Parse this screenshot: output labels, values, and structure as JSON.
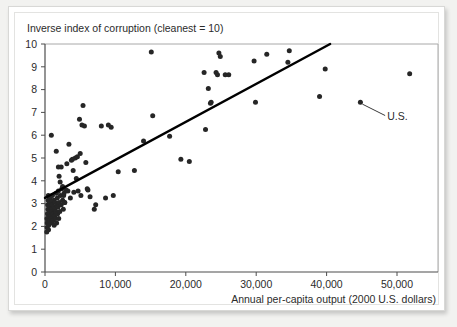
{
  "figure": {
    "title": "Inverse index of corruption (cleanest = 10)",
    "x_axis_label": "Annual per-capita output (2000 U.S. dollars)",
    "annotation_label": "U.S.",
    "point_color": "#262626",
    "trend_color": "#000000",
    "axis_color": "#4d4d4d",
    "background_color": "#ffffff"
  },
  "chart_data": {
    "type": "scatter",
    "title": "Inverse index of corruption (cleanest = 10)",
    "xlabel": "Annual per-capita output (2000 U.S. dollars)",
    "ylabel": "Inverse index of corruption (cleanest = 10)",
    "xlim": [
      0,
      55000
    ],
    "ylim": [
      0,
      10
    ],
    "grid": false,
    "legend": null,
    "xticks": [
      0,
      10000,
      20000,
      30000,
      40000,
      50000
    ],
    "xticklabels": [
      "0",
      "10,000",
      "20,000",
      "30,000",
      "40,000",
      "50,000"
    ],
    "yticks": [
      0,
      1,
      2,
      3,
      4,
      5,
      6,
      7,
      8,
      9,
      10
    ],
    "yticklabels": [
      "0",
      "1",
      "2",
      "3",
      "4",
      "5",
      "6",
      "7",
      "8",
      "9",
      "10"
    ],
    "annotations": [
      {
        "text": "U.S.",
        "point_x": 44800,
        "point_y": 7.45,
        "label_x": 48600,
        "label_y": 6.95
      }
    ],
    "trendline": {
      "type": "linear",
      "x_start": 0,
      "y_start": 3.25,
      "x_end": 40500,
      "y_end": 10.0
    },
    "points": [
      [
        250,
        1.75
      ],
      [
        300,
        1.95
      ],
      [
        320,
        2.15
      ],
      [
        280,
        2.35
      ],
      [
        350,
        2.55
      ],
      [
        400,
        2.25
      ],
      [
        420,
        2.75
      ],
      [
        380,
        2.95
      ],
      [
        450,
        3.15
      ],
      [
        470,
        3.35
      ],
      [
        500,
        1.85
      ],
      [
        520,
        2.05
      ],
      [
        560,
        2.45
      ],
      [
        590,
        2.65
      ],
      [
        610,
        2.85
      ],
      [
        640,
        3.05
      ],
      [
        680,
        2.25
      ],
      [
        700,
        2.55
      ],
      [
        720,
        3.25
      ],
      [
        760,
        2.95
      ],
      [
        800,
        2.15
      ],
      [
        830,
        2.45
      ],
      [
        860,
        2.75
      ],
      [
        900,
        3.05
      ],
      [
        940,
        2.35
      ],
      [
        980,
        2.65
      ],
      [
        1000,
        2.95
      ],
      [
        1050,
        3.35
      ],
      [
        1100,
        2.25
      ],
      [
        1150,
        2.55
      ],
      [
        1200,
        2.85
      ],
      [
        1250,
        3.15
      ],
      [
        1300,
        2.05
      ],
      [
        1350,
        2.45
      ],
      [
        1400,
        2.75
      ],
      [
        1450,
        3.05
      ],
      [
        1500,
        2.35
      ],
      [
        1550,
        2.65
      ],
      [
        1600,
        3.45
      ],
      [
        1650,
        2.15
      ],
      [
        1700,
        2.95
      ],
      [
        1750,
        3.25
      ],
      [
        1800,
        2.55
      ],
      [
        1850,
        2.85
      ],
      [
        1900,
        3.55
      ],
      [
        1950,
        2.35
      ],
      [
        2000,
        3.05
      ],
      [
        2100,
        2.65
      ],
      [
        2200,
        3.35
      ],
      [
        2300,
        2.95
      ],
      [
        2400,
        3.65
      ],
      [
        2500,
        3.15
      ],
      [
        2600,
        2.75
      ],
      [
        2700,
        3.45
      ],
      [
        2800,
        3.05
      ],
      [
        900,
        6.0
      ],
      [
        1600,
        5.3
      ],
      [
        1900,
        4.6
      ],
      [
        2000,
        4.2
      ],
      [
        2150,
        3.95
      ],
      [
        2300,
        4.6
      ],
      [
        2500,
        3.75
      ],
      [
        2650,
        3.35
      ],
      [
        2800,
        3.05
      ],
      [
        3000,
        3.6
      ],
      [
        3100,
        4.75
      ],
      [
        3250,
        3.55
      ],
      [
        3400,
        5.6
      ],
      [
        3600,
        3.25
      ],
      [
        3750,
        4.9
      ],
      [
        3900,
        4.95
      ],
      [
        4000,
        4.45
      ],
      [
        4100,
        3.5
      ],
      [
        4300,
        5.0
      ],
      [
        4450,
        4.1
      ],
      [
        4600,
        5.05
      ],
      [
        4700,
        3.55
      ],
      [
        4900,
        6.7
      ],
      [
        5000,
        5.2
      ],
      [
        5100,
        3.35
      ],
      [
        5250,
        6.45
      ],
      [
        5400,
        7.3
      ],
      [
        5600,
        6.4
      ],
      [
        5800,
        4.8
      ],
      [
        6000,
        3.65
      ],
      [
        6100,
        3.6
      ],
      [
        6400,
        3.3
      ],
      [
        7000,
        2.75
      ],
      [
        7200,
        2.95
      ],
      [
        8000,
        6.4
      ],
      [
        8600,
        3.25
      ],
      [
        9000,
        6.45
      ],
      [
        9400,
        6.35
      ],
      [
        9700,
        3.35
      ],
      [
        10400,
        4.4
      ],
      [
        12700,
        4.45
      ],
      [
        14000,
        5.75
      ],
      [
        15100,
        9.65
      ],
      [
        15300,
        6.85
      ],
      [
        17700,
        5.95
      ],
      [
        19300,
        4.95
      ],
      [
        20500,
        4.85
      ],
      [
        22600,
        8.75
      ],
      [
        22800,
        6.25
      ],
      [
        23200,
        8.05
      ],
      [
        23500,
        7.4
      ],
      [
        23600,
        7.45
      ],
      [
        24300,
        8.75
      ],
      [
        24500,
        8.65
      ],
      [
        24700,
        9.6
      ],
      [
        24900,
        9.45
      ],
      [
        25600,
        8.65
      ],
      [
        26100,
        8.65
      ],
      [
        29700,
        9.25
      ],
      [
        29900,
        7.45
      ],
      [
        31500,
        9.55
      ],
      [
        34500,
        9.2
      ],
      [
        34700,
        9.7
      ],
      [
        39000,
        7.7
      ],
      [
        39800,
        8.9
      ],
      [
        44800,
        7.45
      ],
      [
        51800,
        8.7
      ]
    ]
  }
}
